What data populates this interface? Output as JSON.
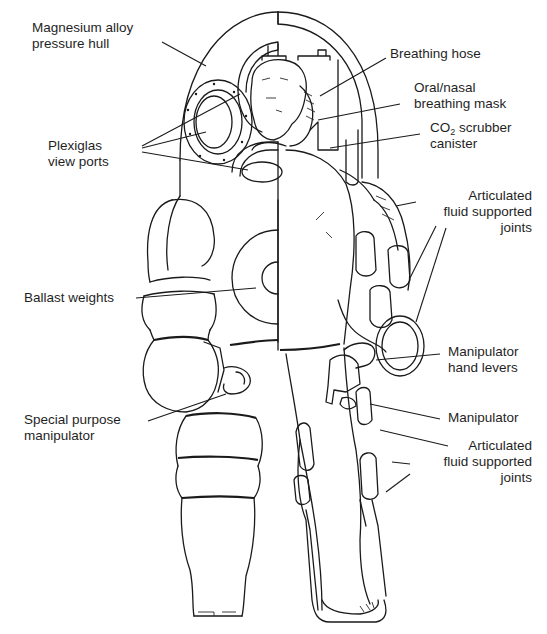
{
  "figure": {
    "labels": [
      {
        "id": "pressure-hull",
        "lines": [
          "Magnesium alloy",
          "pressure hull"
        ]
      },
      {
        "id": "breathing-hose",
        "lines": [
          "Breathing hose"
        ]
      },
      {
        "id": "breathing-mask",
        "lines": [
          "Oral/nasal",
          "breathing mask"
        ]
      },
      {
        "id": "co2-scrubber",
        "lines": [
          "CO",
          "2",
          " scrubber",
          "canister"
        ]
      },
      {
        "id": "view-ports",
        "lines": [
          "Plexiglas",
          "view ports"
        ]
      },
      {
        "id": "arm-joints",
        "lines": [
          "Articulated",
          "fluid supported",
          "joints"
        ]
      },
      {
        "id": "ballast-weights",
        "lines": [
          "Ballast weights"
        ]
      },
      {
        "id": "hand-levers",
        "lines": [
          "Manipulator",
          "hand levers"
        ]
      },
      {
        "id": "special-manipulator",
        "lines": [
          "Special purpose",
          "manipulator"
        ]
      },
      {
        "id": "manipulator",
        "lines": [
          "Manipulator"
        ]
      },
      {
        "id": "leg-joints",
        "lines": [
          "Articulated",
          "fluid supported",
          "joints"
        ]
      }
    ]
  },
  "colors": {
    "ink": "#1a1a1a",
    "background": "#ffffff"
  }
}
